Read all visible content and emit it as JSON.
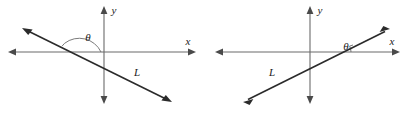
{
  "figure": {
    "type": "geometry-diagram",
    "background_color": "#ffffff",
    "axis_color": "#6b6b6b",
    "line_color": "#2b2b2b",
    "label_color": "#1a1a1a",
    "panels": [
      {
        "id": "left",
        "name": "obtuse-inclination",
        "axes": {
          "x_label": "x",
          "y_label": "y",
          "origin": {
            "x": 104,
            "y": 52
          },
          "x_extent": [
            8,
            196
          ],
          "y_extent": [
            6,
            104
          ]
        },
        "line": {
          "label": "L",
          "label_position": {
            "x": 137,
            "y": 73
          },
          "endpoints": [
            {
              "x": 22,
              "y": 28
            },
            {
              "x": 172,
              "y": 102
            }
          ],
          "arrowheads": "both",
          "slope_sign": "negative",
          "x_intercept": {
            "x": 77,
            "y": 52
          }
        },
        "angle": {
          "symbol": "θ",
          "label_position": {
            "x": 88,
            "y": 40
          },
          "arc_radius": 24,
          "measured_from": "positive x-axis direction",
          "type": "obtuse"
        }
      },
      {
        "id": "right",
        "name": "acute-inclination",
        "axes": {
          "x_label": "x",
          "y_label": "y",
          "origin": {
            "x": 310,
            "y": 52
          },
          "x_extent": [
            215,
            400
          ],
          "y_extent": [
            6,
            104
          ]
        },
        "line": {
          "label": "L",
          "label_position": {
            "x": 272,
            "y": 73
          },
          "endpoints": [
            {
              "x": 243,
              "y": 102
            },
            {
              "x": 390,
              "y": 29
            }
          ],
          "arrowheads": "both",
          "slope_sign": "positive",
          "x_intercept": {
            "x": 338,
            "y": 52
          }
        },
        "angle": {
          "symbol": "θ",
          "label_position": {
            "x": 348,
            "y": 50
          },
          "arc_radius": 13,
          "measured_from": "positive x-axis direction",
          "type": "acute"
        }
      }
    ]
  }
}
